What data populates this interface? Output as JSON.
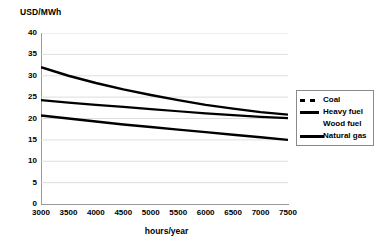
{
  "chart_data": {
    "type": "line",
    "title": "",
    "ylabel": "USD/MWh",
    "xlabel": "hours/year",
    "xlim": [
      3000,
      7500
    ],
    "ylim": [
      0,
      40
    ],
    "yticks": [
      0,
      5,
      10,
      15,
      20,
      25,
      30,
      35,
      40
    ],
    "xticks": [
      3000,
      3500,
      4000,
      4500,
      5000,
      5500,
      6000,
      6500,
      7000,
      7500
    ],
    "grid": "horizontal",
    "legend_position": "right",
    "x": [
      3000,
      3500,
      4000,
      4500,
      5000,
      5500,
      6000,
      6500,
      7000,
      7500
    ],
    "series": [
      {
        "name": "Coal",
        "style": "dashed",
        "values": [
          32.0,
          30.0,
          28.3,
          26.8,
          25.5,
          24.3,
          23.2,
          22.3,
          21.5,
          20.9
        ]
      },
      {
        "name": "Heavy fuel",
        "style": "solid-thin",
        "values": [
          24.3,
          23.7,
          23.2,
          22.7,
          22.2,
          21.7,
          21.2,
          20.8,
          20.4,
          20.1
        ]
      },
      {
        "name": "Wood fuel",
        "style": "none",
        "values": [
          24.3,
          23.7,
          23.2,
          22.7,
          22.2,
          21.7,
          21.2,
          20.8,
          20.4,
          20.1
        ]
      },
      {
        "name": "Natural gas",
        "style": "solid-thick",
        "values": [
          20.7,
          20.0,
          19.3,
          18.6,
          18.0,
          17.4,
          16.8,
          16.2,
          15.6,
          15.0
        ]
      }
    ]
  }
}
